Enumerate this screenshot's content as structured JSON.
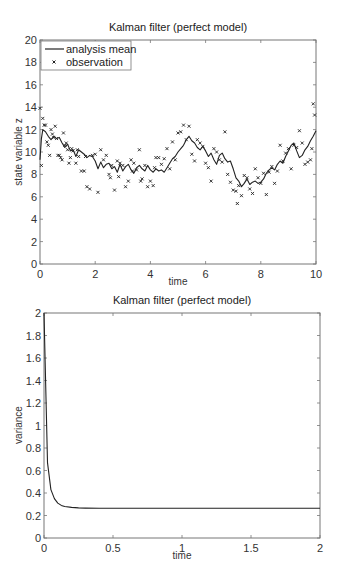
{
  "chart_data": [
    {
      "type": "line",
      "title": "Kalman filter (perfect model)",
      "xlabel": "time",
      "ylabel": "state variable z",
      "xlim": [
        0,
        10
      ],
      "ylim": [
        0,
        20
      ],
      "xticks": [
        0,
        2,
        4,
        6,
        8,
        10
      ],
      "yticks": [
        0,
        2,
        4,
        6,
        8,
        10,
        12,
        14,
        16,
        18,
        20
      ],
      "grid": false,
      "legend": {
        "position": "upper left",
        "entries": [
          {
            "label": "analysis mean",
            "marker": "line"
          },
          {
            "label": "observation",
            "marker": "x"
          }
        ]
      },
      "series": [
        {
          "name": "analysis mean",
          "style": "line",
          "x": [
            0,
            0.05,
            0.1,
            0.2,
            0.3,
            0.4,
            0.5,
            0.6,
            0.7,
            0.8,
            0.9,
            1.0,
            1.1,
            1.2,
            1.3,
            1.4,
            1.5,
            1.6,
            1.7,
            1.8,
            1.9,
            2.0,
            2.1,
            2.2,
            2.3,
            2.4,
            2.5,
            2.6,
            2.7,
            2.8,
            2.9,
            3.0,
            3.1,
            3.2,
            3.3,
            3.4,
            3.5,
            3.6,
            3.7,
            3.8,
            3.9,
            4.0,
            4.1,
            4.2,
            4.3,
            4.4,
            4.5,
            4.6,
            4.7,
            4.8,
            4.9,
            5.0,
            5.1,
            5.2,
            5.3,
            5.4,
            5.5,
            5.6,
            5.7,
            5.8,
            5.9,
            6.0,
            6.1,
            6.2,
            6.3,
            6.4,
            6.5,
            6.6,
            6.7,
            6.8,
            6.9,
            7.0,
            7.1,
            7.2,
            7.3,
            7.4,
            7.5,
            7.6,
            7.7,
            7.8,
            7.9,
            8.0,
            8.1,
            8.2,
            8.3,
            8.4,
            8.5,
            8.6,
            8.7,
            8.8,
            8.9,
            9.0,
            9.1,
            9.2,
            9.3,
            9.4,
            9.5,
            9.6,
            9.7,
            9.8,
            9.9,
            10.0
          ],
          "y": [
            9.3,
            11.2,
            12.0,
            11.8,
            11.4,
            11.1,
            11.4,
            11.2,
            11.3,
            10.8,
            10.4,
            10.7,
            10.1,
            10.2,
            9.6,
            10.2,
            10.0,
            9.8,
            9.5,
            9.7,
            9.6,
            9.2,
            8.5,
            9.1,
            8.6,
            8.9,
            9.0,
            8.5,
            8.7,
            8.2,
            8.9,
            8.3,
            8.7,
            8.9,
            8.4,
            8.1,
            8.6,
            8.8,
            8.5,
            8.3,
            8.8,
            8.4,
            8.2,
            8.5,
            8.3,
            8.4,
            8.2,
            8.6,
            9.0,
            9.4,
            9.6,
            10.0,
            10.3,
            10.6,
            11.1,
            11.4,
            11.0,
            10.8,
            10.4,
            10.2,
            10.5,
            10.1,
            9.6,
            9.9,
            9.3,
            8.9,
            9.7,
            9.9,
            9.4,
            9.1,
            9.2,
            8.5,
            7.7,
            7.4,
            6.9,
            7.2,
            7.6,
            7.1,
            7.3,
            7.4,
            7.2,
            7.3,
            7.6,
            8.1,
            8.4,
            8.6,
            8.4,
            8.9,
            9.2,
            9.0,
            9.6,
            10.1,
            10.6,
            10.8,
            10.1,
            9.5,
            9.7,
            10.2,
            10.5,
            11.0,
            11.4,
            11.9
          ]
        },
        {
          "name": "observation",
          "style": "x-marker",
          "x": [
            0.0,
            0.05,
            0.1,
            0.15,
            0.2,
            0.25,
            0.3,
            0.35,
            0.4,
            0.45,
            0.5,
            0.55,
            0.6,
            0.65,
            0.7,
            0.75,
            0.8,
            0.85,
            0.9,
            0.95,
            1.0,
            1.05,
            1.1,
            1.15,
            1.2,
            1.3,
            1.35,
            1.4,
            1.5,
            1.6,
            1.65,
            1.7,
            1.8,
            1.9,
            2.0,
            2.1,
            2.2,
            2.3,
            2.4,
            2.5,
            2.55,
            2.6,
            2.7,
            2.8,
            2.85,
            2.9,
            3.0,
            3.1,
            3.2,
            3.3,
            3.35,
            3.4,
            3.5,
            3.6,
            3.65,
            3.7,
            3.8,
            3.9,
            4.0,
            4.1,
            4.15,
            4.2,
            4.3,
            4.4,
            4.5,
            4.6,
            4.7,
            4.8,
            4.9,
            5.0,
            5.1,
            5.2,
            5.3,
            5.4,
            5.5,
            5.6,
            5.7,
            5.8,
            5.9,
            6.0,
            6.1,
            6.2,
            6.3,
            6.4,
            6.5,
            6.6,
            6.7,
            6.8,
            6.9,
            7.0,
            7.1,
            7.15,
            7.2,
            7.3,
            7.4,
            7.5,
            7.6,
            7.7,
            7.8,
            7.9,
            8.0,
            8.1,
            8.2,
            8.3,
            8.4,
            8.5,
            8.6,
            8.7,
            8.8,
            8.9,
            9.0,
            9.1,
            9.2,
            9.3,
            9.4,
            9.5,
            9.6,
            9.7,
            9.8,
            9.85,
            9.9,
            9.95
          ],
          "y": [
            13.9,
            8.8,
            13.0,
            12.4,
            12.4,
            10.9,
            10.6,
            9.7,
            12.0,
            11.6,
            11.3,
            12.3,
            11.2,
            9.7,
            9.7,
            9.5,
            9.3,
            11.7,
            10.6,
            10.8,
            10.2,
            9.0,
            9.5,
            10.3,
            10.1,
            9.0,
            10.2,
            9.6,
            8.3,
            8.3,
            9.6,
            6.9,
            6.7,
            9.7,
            9.8,
            6.4,
            10.2,
            9.3,
            9.7,
            8.0,
            7.7,
            8.8,
            6.6,
            9.2,
            7.8,
            9.0,
            8.8,
            6.9,
            7.4,
            9.3,
            8.3,
            9.0,
            8.4,
            10.2,
            7.4,
            7.6,
            8.8,
            6.9,
            7.4,
            7.0,
            8.6,
            9.5,
            9.5,
            8.9,
            9.4,
            10.3,
            8.5,
            10.9,
            9.3,
            11.7,
            11.8,
            12.4,
            11.1,
            12.3,
            9.8,
            9.2,
            11.1,
            10.8,
            10.5,
            9.0,
            8.6,
            7.4,
            10.3,
            10.0,
            9.3,
            9.1,
            11.8,
            8.0,
            7.3,
            6.6,
            6.5,
            5.4,
            7.0,
            6.1,
            7.9,
            7.7,
            6.7,
            6.3,
            8.5,
            7.7,
            7.2,
            8.1,
            6.2,
            8.2,
            8.7,
            7.2,
            8.3,
            10.6,
            9.2,
            9.9,
            10.3,
            8.5,
            10.6,
            10.4,
            11.9,
            10.8,
            8.9,
            9.1,
            9.3,
            10.3,
            14.3,
            13.3
          ]
        }
      ]
    },
    {
      "type": "line",
      "title": "Kalman filter (perfect model)",
      "xlabel": "time",
      "ylabel": "variance",
      "xlim": [
        0,
        2
      ],
      "ylim": [
        0,
        2
      ],
      "xticks": [
        0,
        0.5,
        1,
        1.5,
        2
      ],
      "xtick_labels": [
        "0",
        "0.5",
        "1",
        "1.5",
        "2"
      ],
      "yticks": [
        0,
        0.2,
        0.4,
        0.6,
        0.8,
        1,
        1.2,
        1.4,
        1.6,
        1.8,
        2
      ],
      "ytick_labels": [
        "0",
        "0.2",
        "0.4",
        "0.6",
        "0.8",
        "1",
        "1.2",
        "1.4",
        "1.6",
        "1.8",
        "2"
      ],
      "grid": false,
      "series": [
        {
          "name": "variance",
          "style": "line",
          "x": [
            0,
            0.025,
            0.05,
            0.075,
            0.1,
            0.125,
            0.15,
            0.2,
            0.25,
            0.3,
            0.4,
            0.5,
            0.75,
            1.0,
            1.5,
            2.0
          ],
          "y": [
            2.0,
            0.67,
            0.43,
            0.35,
            0.31,
            0.29,
            0.28,
            0.272,
            0.268,
            0.266,
            0.265,
            0.265,
            0.265,
            0.265,
            0.265,
            0.265
          ]
        }
      ]
    }
  ],
  "charts": {
    "top": {
      "title": "Kalman filter (perfect model)",
      "xlabel": "time",
      "ylabel": "state variable z",
      "legend_line": "analysis mean",
      "legend_marker": "observation"
    },
    "bottom": {
      "title": "Kalman filter (perfect model)",
      "xlabel": "time",
      "ylabel": "variance"
    }
  }
}
